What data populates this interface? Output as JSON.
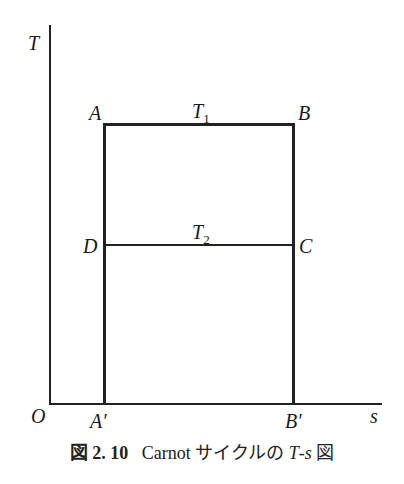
{
  "diagram": {
    "type": "T-s diagram",
    "axes": {
      "y_label": "T",
      "x_label": "s",
      "origin_label": "O"
    },
    "points": {
      "A": "A",
      "B": "B",
      "C": "C",
      "D": "D",
      "A_prime": "A′",
      "B_prime": "B′"
    },
    "isotherms": {
      "upper": {
        "symbol": "T",
        "sub": "1"
      },
      "lower": {
        "symbol": "T",
        "sub": "2"
      }
    }
  },
  "caption": {
    "fig_label": "図 2. 10",
    "text": "Carnot サイクルの ",
    "var": "T",
    "dash": "-",
    "var2": "s",
    "suffix": " 図"
  }
}
